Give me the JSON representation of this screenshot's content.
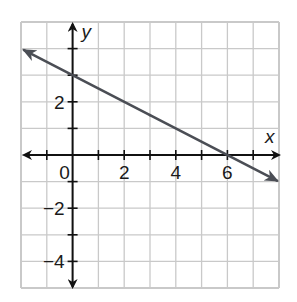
{
  "chart_data": {
    "type": "line",
    "title": "",
    "xlabel": "x",
    "ylabel": "y",
    "xlim": [
      -2,
      8
    ],
    "ylim": [
      -5,
      5
    ],
    "grid": true,
    "grid_step": 1,
    "x_tick_labels": [
      {
        "value": 0,
        "label": "0"
      },
      {
        "value": 2,
        "label": "2"
      },
      {
        "value": 4,
        "label": "4"
      },
      {
        "value": 6,
        "label": "6"
      }
    ],
    "y_tick_labels": [
      {
        "value": 2,
        "label": "2"
      },
      {
        "value": -2,
        "label": "−2"
      },
      {
        "value": -4,
        "label": "−4"
      }
    ],
    "series": [
      {
        "name": "line",
        "equation": "y = -0.5x + 3",
        "x": [
          -2,
          0,
          6,
          8
        ],
        "y": [
          4,
          3,
          0,
          -1
        ],
        "arrows_both_ends": true,
        "color": "#4b4e55"
      }
    ],
    "legend": null
  },
  "colors": {
    "grid": "#c9c9c9",
    "axes": "#111111",
    "line": "#4b4e55",
    "background": "#ffffff"
  }
}
